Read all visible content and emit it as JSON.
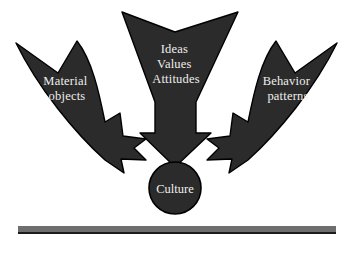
{
  "diagram": {
    "background_color": "#ffffff",
    "arrow_fill": "#2b2b2b",
    "arrow_stroke": "#000000",
    "label_color": "#efefec",
    "baseline_color": "#6e6e6e",
    "baseline_shadow_color": "#1c1c1c",
    "center_node": {
      "label": "Culture",
      "shape": "circle",
      "cx": 175,
      "cy": 188,
      "r": 26
    },
    "arrows": [
      {
        "id": "material-objects",
        "label_lines": [
          "Material",
          "objects"
        ],
        "direction": "down-right",
        "origin": "upper-left"
      },
      {
        "id": "ideas-values-attitudes",
        "label_lines": [
          "Ideas",
          "Values",
          "Attitudes"
        ],
        "direction": "down",
        "origin": "top-center"
      },
      {
        "id": "behavior-patterns",
        "label_lines": [
          "Behavior",
          "patterns"
        ],
        "direction": "down-left",
        "origin": "upper-right"
      }
    ],
    "baseline": {
      "x": 18,
      "y": 226,
      "width": 318,
      "height": 7
    }
  }
}
